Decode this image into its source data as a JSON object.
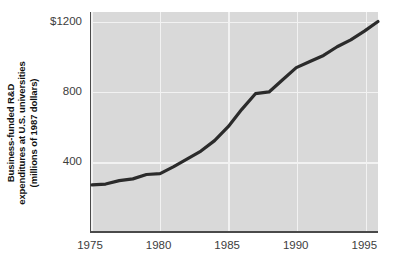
{
  "chart_data": {
    "type": "line",
    "title": "",
    "subtitle": "",
    "xlabel": "",
    "ylabel": "Business-funded R&D expenditures at U.S. universities (millions of 1987 dollars)",
    "ylabel_lines": [
      "Business-funded R&D",
      "expenditures at U.S. universities",
      "(millions of 1987 dollars)"
    ],
    "xlim": [
      1975,
      1996
    ],
    "ylim": [
      0,
      1260
    ],
    "grid": true,
    "legend": "none",
    "y_ticks": [
      400,
      800,
      1200
    ],
    "y_tick_labels": [
      "400",
      "800",
      "$1200"
    ],
    "x_ticks": [
      1975,
      1980,
      1985,
      1990,
      1995
    ],
    "x_tick_labels": [
      "1975",
      "1980",
      "1985",
      "1990",
      "1995"
    ],
    "series": [
      {
        "name": "Business-funded R&D expenditures",
        "color": "#2b2b2b",
        "x": [
          1975,
          1976,
          1977,
          1978,
          1979,
          1980,
          1981,
          1982,
          1983,
          1984,
          1985,
          1986,
          1987,
          1988,
          1989,
          1990,
          1991,
          1992,
          1993,
          1994,
          1995,
          1996
        ],
        "values": [
          265,
          270,
          290,
          300,
          325,
          330,
          370,
          415,
          460,
          520,
          600,
          700,
          790,
          800,
          870,
          940,
          975,
          1010,
          1060,
          1100,
          1150,
          1205
        ]
      }
    ],
    "colors": {
      "plot_background": "#d9d9d9",
      "gridline": "#f2f2f2",
      "axis": "#4a4a4a",
      "line": "#2b2b2b",
      "text": "#3d3d3d",
      "page_background": "#ffffff"
    },
    "geometry": {
      "plot_left": 90,
      "plot_top": 12,
      "plot_width": 288,
      "plot_height": 221
    }
  }
}
